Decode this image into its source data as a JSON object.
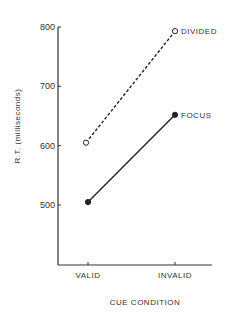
{
  "chart_data": {
    "type": "line",
    "title": "",
    "xlabel": "CUE CONDITION",
    "ylabel": "R.T. (milliseconds)",
    "categories": [
      "VALID",
      "INVALID"
    ],
    "series": [
      {
        "name": "DIVIDED",
        "values": [
          605,
          793
        ],
        "style": "dashed",
        "marker": "open-circle"
      },
      {
        "name": "FOCUS",
        "values": [
          505,
          652
        ],
        "style": "solid",
        "marker": "filled-circle"
      }
    ],
    "yticks": [
      500,
      600,
      700,
      800
    ],
    "ytick_labels": [
      "500",
      "600",
      "700",
      "800"
    ],
    "ylim": [
      400,
      800
    ],
    "grid": false,
    "legend": "inline labels at line ends"
  }
}
